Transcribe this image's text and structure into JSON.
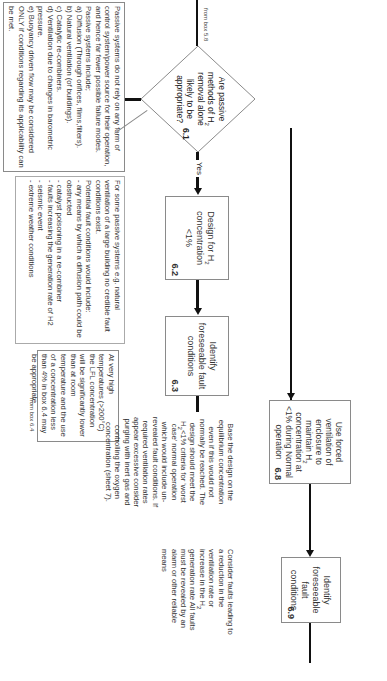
{
  "diagram": {
    "orientation": "rotated 90 degrees clockwise",
    "start_label": "from box 5.8",
    "decision": {
      "id": "6.1",
      "text_parts": [
        "Are passive methods of H",
        "2",
        " removal alone likely to be appropriate?"
      ]
    },
    "branches": {
      "yes": "Yes",
      "no": "No"
    },
    "boxes": [
      {
        "id": "6.2",
        "text_parts": [
          "Design for H",
          "2",
          " concentration <1%"
        ]
      },
      {
        "id": "6.3",
        "text": "Identify foreseeable fault conditions"
      },
      {
        "id": "6.8",
        "text_parts": [
          "Use forced ventilation of enclosure to maintain H",
          "2",
          " concentration at <1% during Normal operation"
        ]
      },
      {
        "id": "6.9",
        "text": "Identify foreseeable fault conditions"
      }
    ],
    "notes": {
      "passive_systems": {
        "lines": [
          "Passive systems do not rely on any form of control system/power source for their operation, and hence far fewer possible failure modes.",
          "Passive systems include;",
          "a) Diffusion (Through orifices, films,filters).",
          "b) Natural ventilation (of buildings).",
          "c) Catalytic re-combiners.",
          "d) Ventilation due to changes in barometric pressure.",
          "e) Buoyancy driven flow may be considered  ONLY if conditions regarding its applicability can be met."
        ]
      },
      "fault_conditions": {
        "lines": [
          "For some passive systems e.g. natural ventilation of a large building no credible fault conditions exist.",
          "Potential fault conditions would include:",
          "- any means by which a diffusion path could be obstructed",
          "- catalyst poisoning in a re-combiner",
          "- faults increasing the generation rate of H2",
          "- seismic event",
          "- extreme weather conditions"
        ]
      },
      "high_temperature": {
        "text": "At very high temperatures (>200°C) the LFL concentration will be significantly lower than at room temperature and the use of a concentration less than 4% in box 6.4 may be appropriate.",
        "footer": "from box 6.4"
      },
      "equilibrium": {
        "text_parts": [
          "Base the design on the equilibrium concentration even if this would not normally be reached. The design should meet the H",
          "2",
          "<1% criteria for 'worst case' normal operation which would include un-revealed fault conditions. If required ventilation rates appear excessive consider purging with inert gas and controlling the oxygen concentration (sheet 7)."
        ]
      },
      "consider_faults": {
        "text_parts": [
          "Consider faults leading to a reduction in the ventilation rate or increase in the H",
          "2",
          " generation rate All faults must be revealed by an alarm or other reliable means"
        ]
      }
    },
    "colors": {
      "line": "#111111",
      "box_border": "#8a8a8a",
      "text": "#333333",
      "background": "#ffffff"
    }
  }
}
